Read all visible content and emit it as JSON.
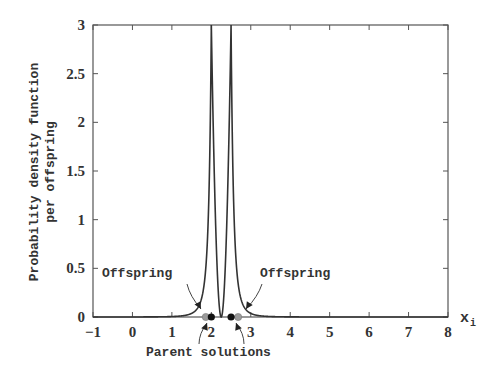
{
  "chart_data": {
    "type": "line",
    "title": "",
    "xlabel": "x_i",
    "ylabel": "Probability density function per offspring",
    "ylabel_lines": [
      "Probability density function",
      "per offspring"
    ],
    "xlim": [
      -1,
      8
    ],
    "ylim": [
      0,
      3
    ],
    "grid": false,
    "xticks": [
      -1,
      0,
      1,
      2,
      3,
      4,
      5,
      6,
      7,
      8
    ],
    "xtick_labels": [
      "−1",
      "0",
      "1",
      "2",
      "3",
      "4",
      "5",
      "6",
      "7",
      "8"
    ],
    "yticks": [
      0,
      0.5,
      1,
      1.5,
      2,
      2.5,
      3
    ],
    "ytick_labels": [
      "0",
      "0.5",
      "1",
      "1.5",
      "2",
      "2.5",
      "3"
    ],
    "series": [
      {
        "name": "Probability density (SBX)",
        "parents": [
          2.0,
          2.5
        ],
        "peak_value": 3.0,
        "eta": 2,
        "description": "Two sharp peaks centered at the parent solutions, decaying toward 0 on both sides; narrow trough between parents"
      }
    ],
    "markers": {
      "parents": {
        "x": [
          2.0,
          2.5
        ],
        "y": [
          0,
          0
        ],
        "color": "#111111",
        "label": "Parent solutions"
      },
      "offspring": {
        "x": [
          1.86,
          2.68
        ],
        "y": [
          0,
          0
        ],
        "color": "#9a9a9a",
        "label": "Offspring"
      }
    },
    "annotations": [
      {
        "text": "Offspring",
        "target_x": 1.86,
        "position": "upper-left"
      },
      {
        "text": "Offspring",
        "target_x": 2.68,
        "position": "upper-right"
      },
      {
        "text": "Parent solutions",
        "targets_x": [
          2.0,
          2.5
        ],
        "position": "below-axis"
      }
    ]
  },
  "labels": {
    "ylabel_line1": "Probability density function",
    "ylabel_line2": "per offspring",
    "xlabel_main": "x",
    "xlabel_sub": "i",
    "offspring_left": "Offspring",
    "offspring_right": "Offspring",
    "parents": "Parent solutions"
  },
  "colors": {
    "axis": "#555555",
    "curve": "#333333",
    "parent_dot": "#111111",
    "offspring_dot": "#9a9a9a"
  }
}
